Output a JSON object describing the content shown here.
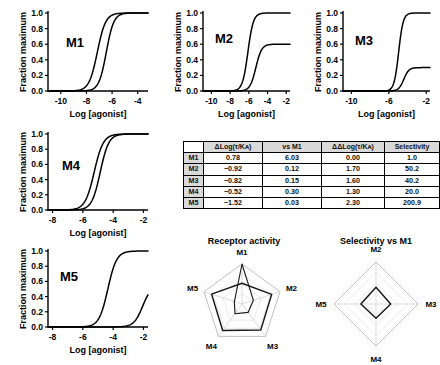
{
  "figure": {
    "axis_x_label": "Log [agonist]",
    "axis_y_label": "Fraction maximum"
  },
  "panels": [
    {
      "id": "M1",
      "label": "M1",
      "xlabel": "Log [agonist]",
      "ylabel": "Fraction maximum",
      "xticks": [
        "-10",
        "-8",
        "-6",
        "-4"
      ],
      "yticks": [
        "1.0",
        "0.8",
        "0.6",
        "0.4",
        "0.2",
        "0.0"
      ],
      "xlim": [
        -11,
        -3.2
      ],
      "ylim": [
        0,
        1.05
      ],
      "curves": [
        {
          "name": "curve-a",
          "ec50": -7.15,
          "top": 1.0,
          "hill": 1.35
        },
        {
          "name": "curve-b",
          "ec50": -6.45,
          "top": 1.0,
          "hill": 1.5
        }
      ]
    },
    {
      "id": "M2",
      "label": "M2",
      "xlabel": "Log [agonist]",
      "ylabel": "Fraction maximum",
      "xticks": [
        "-10",
        "-8",
        "-6",
        "-4",
        "-2"
      ],
      "yticks": [
        "1.0",
        "0.8",
        "0.6",
        "0.4",
        "0.2",
        "0.0"
      ],
      "xlim": [
        -10.9,
        -1.6
      ],
      "ylim": [
        0,
        1.05
      ],
      "curves": [
        {
          "name": "curve-a",
          "ec50": -6.1,
          "top": 1.0,
          "hill": 1.5
        },
        {
          "name": "curve-b",
          "ec50": -5.25,
          "top": 0.6,
          "hill": 1.4
        }
      ]
    },
    {
      "id": "M3",
      "label": "M3",
      "xlabel": "Log [agonist]",
      "ylabel": "Fraction maximum",
      "xticks": [
        "-10",
        "-6",
        "-2"
      ],
      "yticks": [
        "1.0",
        "0.8",
        "0.6",
        "0.4",
        "0.2",
        "0.0"
      ],
      "xlim": [
        -10.9,
        -1.6
      ],
      "ylim": [
        0,
        1.05
      ],
      "curves": [
        {
          "name": "curve-a",
          "ec50": -4.95,
          "top": 1.0,
          "hill": 1.8
        },
        {
          "name": "curve-b",
          "ec50": -4.4,
          "top": 0.3,
          "hill": 1.6
        }
      ]
    },
    {
      "id": "M4",
      "label": "M4",
      "xlabel": "Log [agonist]",
      "ylabel": "Fraction maximum",
      "xticks": [
        "-8",
        "-6",
        "-4",
        "-2"
      ],
      "yticks": [
        "1.0",
        "0.8",
        "0.6",
        "0.4",
        "0.2",
        "0.0"
      ],
      "xlim": [
        -8.3,
        -1.7
      ],
      "ylim": [
        0,
        1.05
      ],
      "curves": [
        {
          "name": "curve-a",
          "ec50": -5.25,
          "top": 1.0,
          "hill": 1.45
        },
        {
          "name": "curve-b",
          "ec50": -4.85,
          "top": 1.0,
          "hill": 1.55
        }
      ]
    },
    {
      "id": "M5",
      "label": "M5",
      "xlabel": "Log [agonist]",
      "ylabel": "Fraction maximum",
      "xticks": [
        "-8",
        "-6",
        "-4",
        "-2"
      ],
      "yticks": [
        "1.0",
        "0.8",
        "0.6",
        "0.4",
        "0.2",
        "0.0"
      ],
      "xlim": [
        -8.3,
        -1.7
      ],
      "ylim": [
        0,
        1.05
      ],
      "curves": [
        {
          "name": "curve-a",
          "ec50": -4.35,
          "top": 1.0,
          "hill": 1.5
        },
        {
          "name": "curve-b",
          "ec50": -2.05,
          "top": 0.55,
          "hill": 1.5
        }
      ]
    }
  ],
  "table": {
    "headers": [
      "",
      "ΔLog(τ/Kᴀ)",
      "vs M1",
      "ΔΔLog(τ/Kᴀ)",
      "Selectivity"
    ],
    "rows": [
      {
        "receptor": "M1",
        "dlog": "0.78",
        "vs_m1": "6.03",
        "ddlog": "0.00",
        "selectivity": "1.0"
      },
      {
        "receptor": "M2",
        "dlog": "−0.92",
        "vs_m1": "0.12",
        "ddlog": "1.70",
        "selectivity": "50.2"
      },
      {
        "receptor": "M3",
        "dlog": "−0.82",
        "vs_m1": "0.15",
        "ddlog": "1.60",
        "selectivity": "40.2"
      },
      {
        "receptor": "M4",
        "dlog": "−0.52",
        "vs_m1": "0.30",
        "ddlog": "1.30",
        "selectivity": "20.0"
      },
      {
        "receptor": "M5",
        "dlog": "−1.52",
        "vs_m1": "0.03",
        "ddlog": "2.30",
        "selectivity": "200.9"
      }
    ]
  },
  "radars": [
    {
      "id": "receptor-activity",
      "title": "Receptor activity",
      "axes": [
        "M1",
        "M2",
        "M3",
        "M4",
        "M5"
      ],
      "series": [
        {
          "name": "series-outer",
          "values": [
            0.52,
            0.78,
            0.8,
            0.82,
            0.8
          ]
        },
        {
          "name": "series-inner",
          "values": [
            1.0,
            0.3,
            0.26,
            0.3,
            0.2
          ]
        }
      ]
    },
    {
      "id": "selectivity-vs-m1",
      "title": "Selectivity vs M1",
      "axes": [
        "M2",
        "M3",
        "M4",
        "M5"
      ],
      "series": [
        {
          "name": "series-selectivity",
          "values": [
            0.4,
            0.35,
            0.34,
            0.36
          ]
        }
      ]
    }
  ],
  "chart_data": [
    {
      "type": "line",
      "title": "M1",
      "xlabel": "Log [agonist]",
      "ylabel": "Fraction maximum",
      "xlim": [
        -11,
        -3.2
      ],
      "ylim": [
        0,
        1.0
      ],
      "xticks": [
        -10,
        -8,
        -6,
        -4
      ],
      "yticks": [
        0.0,
        0.2,
        0.4,
        0.6,
        0.8,
        1.0
      ],
      "grid": false,
      "series": [
        {
          "name": "curve-a",
          "ec50": -7.15,
          "emax": 1.0
        },
        {
          "name": "curve-b",
          "ec50": -6.45,
          "emax": 1.0
        }
      ]
    },
    {
      "type": "line",
      "title": "M2",
      "xlabel": "Log [agonist]",
      "ylabel": "Fraction maximum",
      "xlim": [
        -10.9,
        -1.6
      ],
      "ylim": [
        0,
        1.0
      ],
      "xticks": [
        -10,
        -8,
        -6,
        -4,
        -2
      ],
      "yticks": [
        0.0,
        0.2,
        0.4,
        0.6,
        0.8,
        1.0
      ],
      "grid": false,
      "series": [
        {
          "name": "curve-a",
          "ec50": -6.1,
          "emax": 1.0
        },
        {
          "name": "curve-b",
          "ec50": -5.25,
          "emax": 0.6
        }
      ]
    },
    {
      "type": "line",
      "title": "M3",
      "xlabel": "Log [agonist]",
      "ylabel": "Fraction maximum",
      "xlim": [
        -10.9,
        -1.6
      ],
      "ylim": [
        0,
        1.0
      ],
      "xticks": [
        -10,
        -6,
        -2
      ],
      "yticks": [
        0.0,
        0.2,
        0.4,
        0.6,
        0.8,
        1.0
      ],
      "grid": false,
      "series": [
        {
          "name": "curve-a",
          "ec50": -4.95,
          "emax": 1.0
        },
        {
          "name": "curve-b",
          "ec50": -4.4,
          "emax": 0.3
        }
      ]
    },
    {
      "type": "line",
      "title": "M4",
      "xlabel": "Log [agonist]",
      "ylabel": "Fraction maximum",
      "xlim": [
        -8.3,
        -1.7
      ],
      "ylim": [
        0,
        1.0
      ],
      "xticks": [
        -8,
        -6,
        -4,
        -2
      ],
      "yticks": [
        0.0,
        0.2,
        0.4,
        0.6,
        0.8,
        1.0
      ],
      "grid": false,
      "series": [
        {
          "name": "curve-a",
          "ec50": -5.25,
          "emax": 1.0
        },
        {
          "name": "curve-b",
          "ec50": -4.85,
          "emax": 1.0
        }
      ]
    },
    {
      "type": "line",
      "title": "M5",
      "xlabel": "Log [agonist]",
      "ylabel": "Fraction maximum",
      "xlim": [
        -8.3,
        -1.7
      ],
      "ylim": [
        0,
        1.0
      ],
      "xticks": [
        -8,
        -6,
        -4,
        -2
      ],
      "yticks": [
        0.0,
        0.2,
        0.4,
        0.6,
        0.8,
        1.0
      ],
      "grid": false,
      "series": [
        {
          "name": "curve-a",
          "ec50": -4.35,
          "emax": 1.0
        },
        {
          "name": "curve-b",
          "ec50": -2.05,
          "emax": 0.55
        }
      ]
    },
    {
      "type": "table",
      "title": "",
      "columns": [
        "",
        "ΔLog(τ/Kᴀ)",
        "vs M1",
        "ΔΔLog(τ/Kᴀ)",
        "Selectivity"
      ],
      "rows": [
        [
          "M1",
          "0.78",
          "6.03",
          "0.00",
          "1.0"
        ],
        [
          "M2",
          "−0.92",
          "0.12",
          "1.70",
          "50.2"
        ],
        [
          "M3",
          "−0.82",
          "0.15",
          "1.60",
          "40.2"
        ],
        [
          "M4",
          "−0.52",
          "0.30",
          "1.30",
          "20.0"
        ],
        [
          "M5",
          "−1.52",
          "0.03",
          "2.30",
          "200.9"
        ]
      ]
    },
    {
      "type": "radar",
      "title": "Receptor activity",
      "categories": [
        "M1",
        "M2",
        "M3",
        "M4",
        "M5"
      ],
      "series": [
        {
          "name": "series-outer",
          "values": [
            0.52,
            0.78,
            0.8,
            0.82,
            0.8
          ]
        },
        {
          "name": "series-inner",
          "values": [
            1.0,
            0.3,
            0.26,
            0.3,
            0.2
          ]
        }
      ]
    },
    {
      "type": "radar",
      "title": "Selectivity vs M1",
      "categories": [
        "M2",
        "M3",
        "M4",
        "M5"
      ],
      "series": [
        {
          "name": "series-selectivity",
          "values": [
            0.4,
            0.35,
            0.34,
            0.36
          ]
        }
      ]
    }
  ]
}
